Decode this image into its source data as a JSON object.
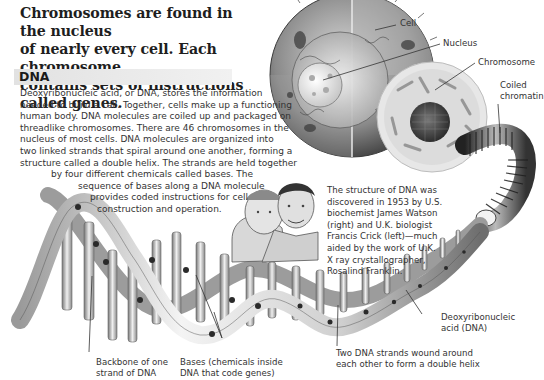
{
  "headline": {
    "lines": [
      "Chromosomes are found in the nucleus",
      "of nearly every cell. Each chromosome",
      "contains sets of instructions called genes."
    ]
  },
  "section": {
    "title": "DNA",
    "bar_color": "#e6e6e6",
    "body_lines": [
      "Deoxyribonucleic acid, or DNA, stores the information",
      "needed to build a cell. Together, cells make up a functioning",
      "human body. DNA molecules are coiled up and packaged on",
      "threadlike chromosomes. There are 46 chromosomes in the",
      "nucleus of most cells. DNA molecules are organized into",
      "two linked strands that spiral around one another, forming a",
      "structure called a double helix. The strands are held together",
      "by four different chemicals called bases. The",
      "sequence of bases along a DNA molecule",
      "provides coded instructions for cell",
      "construction and operation."
    ]
  },
  "caption": {
    "lines": [
      "The structure of DNA was",
      "discovered in 1953 by U.S.",
      "biochemist James Watson",
      "(right) and U.K. biologist",
      "Francis Crick (left)—much",
      "aided by the work of U.K.",
      "X ray crystallographer,",
      "Rosalind Franklin."
    ]
  },
  "labels": {
    "cell": "Cell",
    "nucleus": "Nucleus",
    "chromosome": "Chromosome",
    "coiled_chromatin": [
      "Coiled",
      "chromatin"
    ],
    "dna": [
      "Deoxyribonucleic",
      "acid (DNA)"
    ],
    "double_helix": [
      "Two DNA strands wound around",
      "each other to form a double helix"
    ],
    "bases": [
      "Bases (chemicals inside",
      "DNA that code genes)"
    ],
    "backbone": [
      "Backbone of one",
      "strand of DNA"
    ]
  },
  "illustrations": {
    "cell": "cell-cutaway-illustration",
    "nucleus": "nucleus-illustration",
    "chromatin": "coiled-chromatin-illustration",
    "helix": "dna-double-helix-illustration",
    "scientists": "watson-crick-portrait"
  }
}
